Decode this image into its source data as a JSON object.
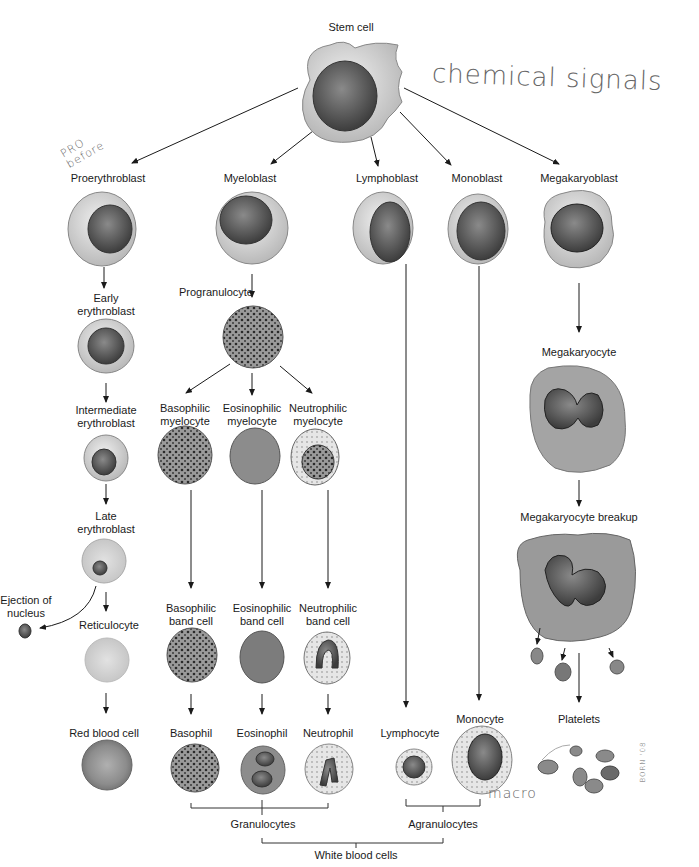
{
  "diagram": {
    "colors": {
      "ink": "#1a1a1a",
      "cytoplasm": "#d8d8d8",
      "nucleus": "#5a5a5a",
      "rbc": "#a0a0a0",
      "handwriting": "#777777"
    },
    "root": {
      "label": "Stem cell"
    },
    "lineages": [
      {
        "id": "erythroid",
        "stages": [
          "Proerythroblast",
          "Early erythroblast",
          "Intermediate erythroblast",
          "Late erythroblast",
          "Reticulocyte",
          "Red blood cell"
        ],
        "side_note": "Ejection of nucleus"
      },
      {
        "id": "myeloid",
        "stages": [
          "Myeloblast",
          "Progranulocyte"
        ],
        "branches": [
          {
            "stages": [
              "Basophilic myelocyte",
              "Basophilic band cell",
              "Basophil"
            ]
          },
          {
            "stages": [
              "Eosinophilic myelocyte",
              "Eosinophilic band cell",
              "Eosinophil"
            ]
          },
          {
            "stages": [
              "Neutrophilic myelocyte",
              "Neutrophilic band cell",
              "Neutrophil"
            ]
          }
        ]
      },
      {
        "id": "lymphoid",
        "stages": [
          "Lymphoblast",
          "Lymphocyte"
        ]
      },
      {
        "id": "monocytic",
        "stages": [
          "Monoblast",
          "Monocyte"
        ]
      },
      {
        "id": "megakaryocytic",
        "stages": [
          "Megakaryoblast",
          "Megakaryocyte",
          "Megakaryocyte breakup",
          "Platelets"
        ]
      }
    ],
    "groupings": {
      "granulocytes": "Granulocytes",
      "agranulocytes": "Agranulocytes",
      "white_blood_cells": "White blood cells"
    }
  },
  "labels": {
    "stem_cell": "Stem cell",
    "proerythroblast": "Proerythroblast",
    "myeloblast": "Myeloblast",
    "lymphoblast": "Lymphoblast",
    "monoblast": "Monoblast",
    "megakaryoblast": "Megakaryoblast",
    "early_erythroblast": "Early\nerythroblast",
    "progranulocyte": "Progranulocyte",
    "megakaryocyte": "Megakaryocyte",
    "intermediate_erythroblast": "Intermediate\nerythroblast",
    "basophilic_myelocyte": "Basophilic\nmyelocyte",
    "eosinophilic_myelocyte": "Eosinophilic\nmyelocyte",
    "neutrophilic_myelocyte": "Neutrophilic\nmyelocyte",
    "late_erythroblast": "Late\nerythroblast",
    "megakaryocyte_breakup": "Megakaryocyte breakup",
    "ejection_of_nucleus": "Ejection of\nnucleus",
    "reticulocyte": "Reticulocyte",
    "basophilic_band_cell": "Basophilic\nband cell",
    "eosinophilic_band_cell": "Eosinophilic\nband cell",
    "neutrophilic_band_cell": "Neutrophilic\nband cell",
    "red_blood_cell": "Red blood cell",
    "basophil": "Basophil",
    "eosinophil": "Eosinophil",
    "neutrophil": "Neutrophil",
    "lymphocyte": "Lymphocyte",
    "monocyte": "Monocyte",
    "platelets": "Platelets",
    "granulocytes": "Granulocytes",
    "agranulocytes": "Agranulocytes",
    "white_blood_cells": "White blood cells"
  },
  "annotations": {
    "chemical_signals": "chemical signals",
    "pro_before": "PRO\nbefore",
    "macro": "macro",
    "artist_signature": "BORN '08"
  }
}
